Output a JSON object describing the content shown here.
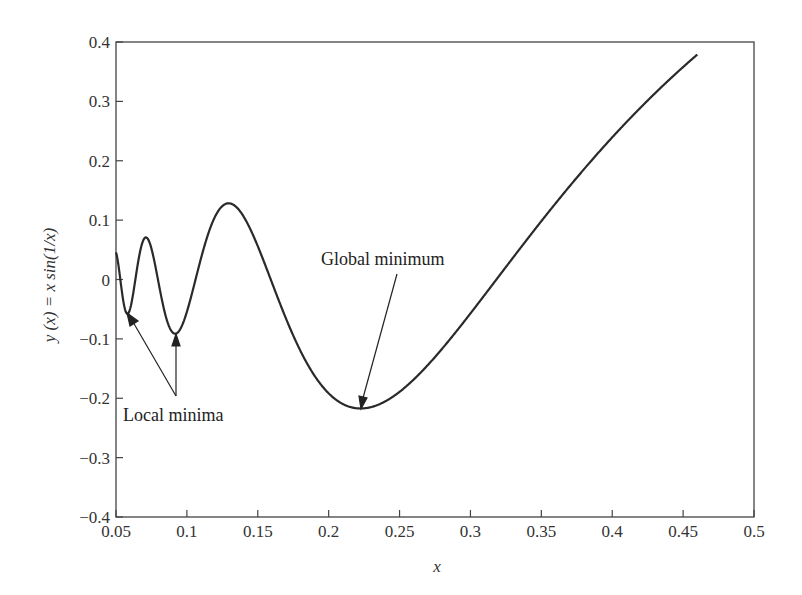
{
  "chart_data": {
    "type": "line",
    "title": "",
    "xlabel": "x",
    "ylabel": "y (x) = x sin(1/x)",
    "xlim": [
      0.05,
      0.5
    ],
    "ylim": [
      -0.4,
      0.4
    ],
    "grid": false,
    "legend": null,
    "x_ticks": [
      "0.05",
      "0.1",
      "0.15",
      "0.2",
      "0.25",
      "0.3",
      "0.35",
      "0.4",
      "0.45",
      "0.5"
    ],
    "y_ticks": [
      "0.4",
      "0.3",
      "0.2",
      "0.1",
      "0",
      "−0.1",
      "−0.2",
      "−0.3",
      "−0.4"
    ],
    "series": [
      {
        "name": "y(x) = x sin(1/x)",
        "x": [
          0.05,
          0.055,
          0.058,
          0.06,
          0.065,
          0.071,
          0.075,
          0.08,
          0.085,
          0.092,
          0.1,
          0.11,
          0.12,
          0.13,
          0.14,
          0.15,
          0.16,
          0.17,
          0.18,
          0.2,
          0.22,
          0.2225,
          0.24,
          0.26,
          0.28,
          0.3,
          0.32,
          0.35,
          0.38,
          0.4,
          0.43,
          0.46
        ],
        "y": [
          0.0456,
          -0.0342,
          -0.058,
          -0.0492,
          0.0206,
          0.0709,
          0.052,
          -0.0053,
          -0.061,
          -0.0913,
          -0.0544,
          0.036,
          0.1064,
          0.128,
          0.106,
          0.0561,
          -0.0053,
          -0.0664,
          -0.1197,
          -0.1918,
          -0.2169,
          -0.2173,
          -0.2054,
          -0.168,
          -0.117,
          -0.057,
          0.0053,
          0.098,
          0.185,
          0.239,
          0.313,
          0.379
        ]
      }
    ],
    "annotations": [
      {
        "text": "Local minima",
        "points_to": [
          [
            0.058,
            -0.058
          ],
          [
            0.092,
            -0.095
          ]
        ]
      },
      {
        "text": "Global minimum",
        "points_to": [
          [
            0.2225,
            -0.217
          ]
        ]
      }
    ]
  },
  "labels": {
    "xlabel": "x",
    "ylabel": "y (x) = x sin(1/x)",
    "local_minima": "Local minima",
    "global_minimum": "Global minimum"
  },
  "colors": {
    "line": "#2a2a2a",
    "axis": "#444444",
    "text": "#333333"
  }
}
